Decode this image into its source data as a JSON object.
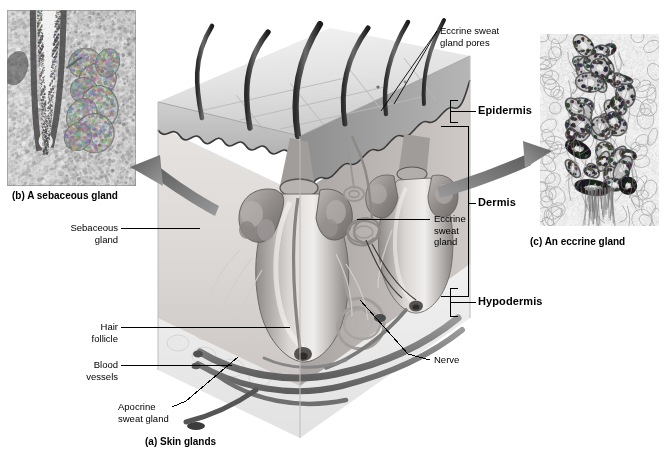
{
  "figure": {
    "title": "Skin glands",
    "background": "#ffffff"
  },
  "captions": [
    {
      "id": "b",
      "text": "(b) A sebaceous gland",
      "x": 12,
      "y": 190
    },
    {
      "id": "c",
      "text": "(c) An eccrine gland",
      "x": 530,
      "y": 236
    },
    {
      "id": "a",
      "text": "(a) Skin glands",
      "x": 145,
      "y": 436
    }
  ],
  "labels": {
    "eccrine_pores": "Eccrine sweat\ngland pores",
    "epidermis": "Epidermis",
    "dermis": "Dermis",
    "hypodermis": "Hypodermis",
    "eccrine_sweat_gland": "Eccrine\nsweat\ngland",
    "nerve": "Nerve",
    "sebaceous_gland": "Sebaceous\ngland",
    "hair_follicle": "Hair\nfollicle",
    "blood_vessels": "Blood\nvessels",
    "apocrine_sweat_gland": "Apocrine\nsweat gland"
  },
  "insets": {
    "sebaceous": {
      "name": "sebaceous-gland-micrograph",
      "x": 7,
      "y": 10,
      "width": 129,
      "height": 176,
      "description": "Light micrograph of a hair follicle with adjacent sebaceous gland"
    },
    "eccrine": {
      "name": "eccrine-gland-micrograph",
      "x": 540,
      "y": 34,
      "width": 119,
      "height": 192,
      "description": "Light micrograph of coiled eccrine sweat gland tubules"
    }
  },
  "brackets": {
    "epidermis": {
      "x": 450,
      "top": 100,
      "bottom": 122,
      "label_x": 478,
      "label_y": 105
    },
    "dermis": {
      "x": 468,
      "top": 126,
      "bottom": 296,
      "label_x": 478,
      "label_y": 203
    },
    "hypodermis": {
      "x": 450,
      "top": 288,
      "bottom": 316,
      "label_x": 478,
      "label_y": 295
    }
  },
  "colors": {
    "ink": "#000000",
    "epidermis_top": "#e7e7e7",
    "epidermis_side": "#9a9a9a",
    "dermis_fill": "#d8d4d2",
    "dermis_side": "#b3aeab",
    "hypodermis": "#efefef",
    "hair_shaft": "#4a4a4a",
    "gland_gray": "#a9a5a4",
    "vessel_gray": "#8c8c8c",
    "arrow_gray": "#8a8a8a"
  },
  "anatomy": {
    "hair_shafts": 6,
    "sebaceous_glands": 2,
    "hair_follicles": 2,
    "apocrine_glands": 1,
    "eccrine_glands": 1,
    "layers": [
      "Epidermis",
      "Dermis",
      "Hypodermis"
    ]
  }
}
